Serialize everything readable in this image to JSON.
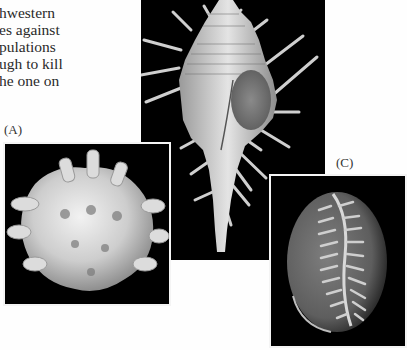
{
  "body_text": {
    "lines": [
      "hwestern",
      "es against",
      "pulations",
      "ugh to kill",
      "he one on"
    ]
  },
  "figures": [
    {
      "id": "A",
      "label": "(A)",
      "subject": "knobbed spiny shell (rock shell)"
    },
    {
      "id": "B",
      "label": "",
      "subject": "long-spined murex shell"
    },
    {
      "id": "C",
      "label": "(C)",
      "subject": "cowrie shell, aperture view with teeth"
    }
  ],
  "colors": {
    "page_background": "#fefefe",
    "photo_background": "#000000",
    "text": "#2a2a2a"
  }
}
